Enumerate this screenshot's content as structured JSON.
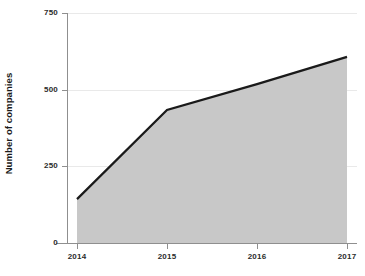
{
  "chart_data": {
    "type": "area",
    "title": "",
    "subtitle": "",
    "xlabel": "",
    "ylabel": "Number of companies",
    "categories": [
      "2014",
      "2015",
      "2016",
      "2017"
    ],
    "x": [
      2014,
      2015,
      2016,
      2017
    ],
    "values": [
      143,
      434,
      518,
      607
    ],
    "series": [
      {
        "name": "Number of companies",
        "values": [
          143,
          434,
          518,
          607
        ]
      }
    ],
    "xlim": [
      2014,
      2017
    ],
    "ylim": [
      0,
      750
    ],
    "ytick_labels": [
      "0",
      "250",
      "500",
      "750"
    ],
    "ytick_values": [
      0,
      250,
      500,
      750
    ],
    "xtick_labels": [
      "2014",
      "2015",
      "2016",
      "2017"
    ],
    "grid": "horizontal",
    "legend": "none",
    "annotations": [],
    "colors": {
      "area_fill": "#c8c8c8",
      "line": "#1a1a1a",
      "gridline": "#e9e9e9",
      "axis": "#8f8f8f",
      "text": "#2b2b2b",
      "background": "#ffffff"
    }
  }
}
